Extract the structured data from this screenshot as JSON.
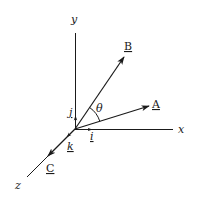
{
  "diagram": {
    "type": "3d-vector-axes",
    "axes": {
      "x": {
        "label": "x"
      },
      "y": {
        "label": "y"
      },
      "z": {
        "label": "z"
      }
    },
    "unit_vectors": {
      "i": {
        "label": "i"
      },
      "j": {
        "label": "j"
      },
      "k": {
        "label": "k"
      }
    },
    "vectors": {
      "A": {
        "label": "A"
      },
      "B": {
        "label": "B"
      },
      "C": {
        "label": "C"
      }
    },
    "angle": {
      "label": "θ",
      "between": [
        "A",
        "B"
      ]
    },
    "colors": {
      "stroke": "#1a1a1a",
      "background": "#ffffff"
    }
  }
}
